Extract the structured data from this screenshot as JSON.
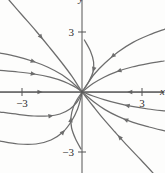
{
  "figure": {
    "kind": "phase-portrait",
    "background_color": "#fdfdfc",
    "curve_color": "#6d6d6d",
    "axis_color": "#555555",
    "text_color": "#2e2e2e"
  },
  "axes": {
    "x_label": "x",
    "y_label": "y",
    "x_ticks": [
      {
        "label": "−3",
        "value": -3
      },
      {
        "label": "3",
        "value": 3
      }
    ],
    "y_ticks": [
      {
        "label": "3",
        "value": 3
      },
      {
        "label": "−3",
        "value": -3
      }
    ],
    "origin_px": {
      "x": 82,
      "y": 92
    },
    "scale_px_per_unit": 20,
    "xlim": [
      -4.1,
      4.1
    ],
    "ylim": [
      -4.05,
      4.6
    ],
    "grid": false
  },
  "chart_data": {
    "type": "line",
    "title": "",
    "xlabel": "x",
    "ylabel": "y",
    "xlim": [
      -4.1,
      4.1
    ],
    "ylim": [
      -4.05,
      4.6
    ],
    "grid": false,
    "legend": "none",
    "equilibrium_points": [
      {
        "x": 0,
        "y": 0,
        "type": "node"
      }
    ],
    "flow_direction": "toward-origin",
    "series": [
      {
        "name": "axis-ray-left",
        "arrow_at": 0.52,
        "points": [
          [
            -4.1,
            0
          ],
          [
            -3.0,
            0
          ],
          [
            -2.0,
            0
          ],
          [
            -1.0,
            0
          ],
          [
            -0.2,
            0
          ],
          [
            0,
            0
          ]
        ]
      },
      {
        "name": "axis-ray-right",
        "arrow_at": 0.45,
        "points": [
          [
            4.1,
            0
          ],
          [
            3.0,
            0
          ],
          [
            2.0,
            0
          ],
          [
            1.0,
            0
          ],
          [
            0.2,
            0
          ],
          [
            0,
            0
          ]
        ]
      },
      {
        "name": "upper-left-shallow",
        "arrow_at": 0.42,
        "points": [
          [
            -4.1,
            1.08
          ],
          [
            -3.2,
            1.0
          ],
          [
            -2.4,
            0.9
          ],
          [
            -1.6,
            0.74
          ],
          [
            -0.9,
            0.52
          ],
          [
            -0.4,
            0.28
          ],
          [
            -0.12,
            0.1
          ],
          [
            0,
            0
          ]
        ]
      },
      {
        "name": "upper-left-mid",
        "arrow_at": 0.4,
        "points": [
          [
            -4.1,
            1.95
          ],
          [
            -3.3,
            1.78
          ],
          [
            -2.5,
            1.55
          ],
          [
            -1.7,
            1.24
          ],
          [
            -1.0,
            0.86
          ],
          [
            -0.45,
            0.44
          ],
          [
            -0.13,
            0.14
          ],
          [
            0,
            0
          ]
        ]
      },
      {
        "name": "upper-left-steep",
        "arrow_at": 0.44,
        "points": [
          [
            -3.65,
            4.6
          ],
          [
            -3.0,
            3.85
          ],
          [
            -2.3,
            3.05
          ],
          [
            -1.6,
            2.2
          ],
          [
            -1.0,
            1.45
          ],
          [
            -0.5,
            0.78
          ],
          [
            -0.15,
            0.24
          ],
          [
            0,
            0
          ]
        ]
      },
      {
        "name": "lower-left-parabola-inner",
        "arrow_at": 0.58,
        "points": [
          [
            -4.1,
            -1.0
          ],
          [
            -3.2,
            -1.12
          ],
          [
            -2.4,
            -1.2
          ],
          [
            -1.7,
            -1.2
          ],
          [
            -1.1,
            -1.1
          ],
          [
            -0.6,
            -0.85
          ],
          [
            -0.25,
            -0.5
          ],
          [
            -0.07,
            -0.18
          ],
          [
            0,
            0
          ]
        ]
      },
      {
        "name": "lower-left-parabola-outer",
        "arrow_at": 0.62,
        "points": [
          [
            -4.1,
            -2.45
          ],
          [
            -3.2,
            -2.6
          ],
          [
            -2.3,
            -2.6
          ],
          [
            -1.55,
            -2.4
          ],
          [
            -0.95,
            -2.0
          ],
          [
            -0.52,
            -1.45
          ],
          [
            -0.22,
            -0.85
          ],
          [
            -0.06,
            -0.3
          ],
          [
            0,
            0
          ]
        ]
      },
      {
        "name": "y-tangent-upper",
        "arrow_at": 0.6,
        "points": [
          [
            0.12,
            2.6
          ],
          [
            0.42,
            2.05
          ],
          [
            0.58,
            1.5
          ],
          [
            0.55,
            1.0
          ],
          [
            0.36,
            0.55
          ],
          [
            0.14,
            0.2
          ],
          [
            0.02,
            0.05
          ],
          [
            0,
            0
          ]
        ]
      },
      {
        "name": "y-tangent-lower",
        "arrow_at": 0.55,
        "points": [
          [
            -0.05,
            -2.85
          ],
          [
            -0.32,
            -2.35
          ],
          [
            -0.52,
            -1.8
          ],
          [
            -0.55,
            -1.25
          ],
          [
            -0.42,
            -0.72
          ],
          [
            -0.2,
            -0.3
          ],
          [
            -0.04,
            -0.07
          ],
          [
            0,
            0
          ]
        ]
      },
      {
        "name": "upper-right-shallow",
        "arrow_at": 0.55,
        "points": [
          [
            4.1,
            1.55
          ],
          [
            3.3,
            1.42
          ],
          [
            2.5,
            1.25
          ],
          [
            1.75,
            1.02
          ],
          [
            1.1,
            0.74
          ],
          [
            0.55,
            0.42
          ],
          [
            0.16,
            0.13
          ],
          [
            0,
            0
          ]
        ]
      },
      {
        "name": "upper-right-steep",
        "arrow_at": 0.58,
        "points": [
          [
            4.15,
            3.15
          ],
          [
            3.35,
            2.85
          ],
          [
            2.55,
            2.48
          ],
          [
            1.8,
            2.0
          ],
          [
            1.15,
            1.45
          ],
          [
            0.62,
            0.9
          ],
          [
            0.2,
            0.3
          ],
          [
            0,
            0
          ]
        ]
      },
      {
        "name": "lower-right-shallow",
        "arrow_at": 0.48,
        "points": [
          [
            4.15,
            -0.95
          ],
          [
            3.3,
            -0.85
          ],
          [
            2.5,
            -0.72
          ],
          [
            1.75,
            -0.56
          ],
          [
            1.1,
            -0.38
          ],
          [
            0.55,
            -0.2
          ],
          [
            0.15,
            -0.05
          ],
          [
            0,
            0
          ]
        ]
      },
      {
        "name": "lower-right-mid",
        "arrow_at": 0.47,
        "points": [
          [
            4.15,
            -1.95
          ],
          [
            3.35,
            -1.75
          ],
          [
            2.55,
            -1.52
          ],
          [
            1.8,
            -1.22
          ],
          [
            1.15,
            -0.88
          ],
          [
            0.6,
            -0.5
          ],
          [
            0.18,
            -0.15
          ],
          [
            0,
            0
          ]
        ]
      },
      {
        "name": "lower-right-steep",
        "arrow_at": 0.48,
        "points": [
          [
            3.55,
            -4.05
          ],
          [
            2.95,
            -3.4
          ],
          [
            2.3,
            -2.72
          ],
          [
            1.65,
            -2.0
          ],
          [
            1.05,
            -1.32
          ],
          [
            0.55,
            -0.7
          ],
          [
            0.16,
            -0.2
          ],
          [
            0,
            0
          ]
        ]
      }
    ]
  }
}
